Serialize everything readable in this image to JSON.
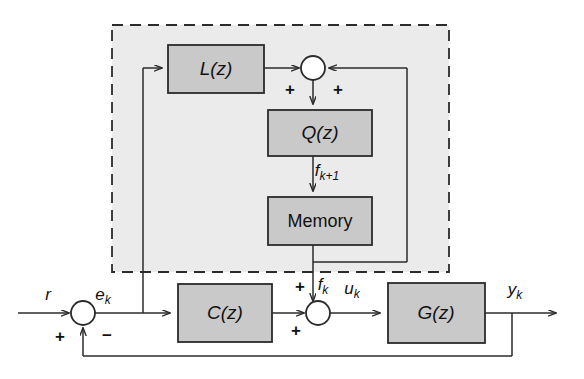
{
  "diagram": {
    "type": "control-block-diagram",
    "canvas": {
      "width": 584,
      "height": 379
    },
    "colors": {
      "background": "#ffffff",
      "block_fill": "#c9c9c9",
      "block_stroke": "#2b2b2b",
      "region_fill": "#ebebeb",
      "region_stroke": "#2b2b2b",
      "line": "#2b2b2b",
      "text": "#111111"
    }
  },
  "region": {
    "name": "learning-controller-region",
    "style": "dashed",
    "x": 112,
    "y": 25,
    "width": 337,
    "height": 247
  },
  "blocks": {
    "l": {
      "label": "L(z)",
      "x": 168,
      "y": 45,
      "width": 96,
      "height": 48
    },
    "q": {
      "label": "Q(z)",
      "x": 268,
      "y": 110,
      "width": 104,
      "height": 46
    },
    "memory": {
      "label": "Memory",
      "x": 268,
      "y": 197,
      "width": 104,
      "height": 48
    },
    "c": {
      "label": "C(z)",
      "x": 178,
      "y": 284,
      "width": 94,
      "height": 58
    },
    "g": {
      "label": "G(z)",
      "x": 388,
      "y": 283,
      "width": 97,
      "height": 60
    }
  },
  "junctions": {
    "top_sum": {
      "name": "top-summing-junction",
      "cx": 313,
      "cy": 68,
      "r": 12
    },
    "error_sum": {
      "name": "error-summing-junction",
      "cx": 83,
      "cy": 313,
      "r": 12
    },
    "control_sum": {
      "name": "control-summing-junction",
      "cx": 318,
      "cy": 313,
      "r": 12
    }
  },
  "signals": {
    "reference": {
      "text": "r",
      "sub": "",
      "x": 48,
      "y": 296
    },
    "error": {
      "text": "e",
      "sub": "k",
      "x": 107,
      "y": 296
    },
    "f_next": {
      "text": "f",
      "sub": "k+1",
      "x": 334,
      "y": 174
    },
    "f_current": {
      "text": "f",
      "sub": "k",
      "x": 329,
      "y": 288
    },
    "control": {
      "text": "u",
      "sub": "k",
      "x": 359,
      "y": 290
    },
    "output": {
      "text": "y",
      "sub": "k",
      "x": 523,
      "y": 291
    }
  },
  "signs": {
    "top_sum_left": {
      "text": "+",
      "x": 290,
      "y": 91
    },
    "top_sum_right": {
      "text": "+",
      "x": 338,
      "y": 91
    },
    "error_plus": {
      "text": "+",
      "x": 60,
      "y": 338
    },
    "error_minus": {
      "text": "−",
      "x": 107,
      "y": 337
    },
    "control_top": {
      "text": "+",
      "x": 300,
      "y": 288
    },
    "control_left": {
      "text": "+",
      "x": 296,
      "y": 332
    }
  }
}
